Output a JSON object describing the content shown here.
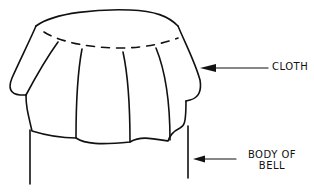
{
  "diagram": {
    "labels": {
      "cloth": "CLOTH",
      "body_line1": "BODY OF",
      "body_line2": "BELL"
    },
    "colors": {
      "line": "#111111",
      "background": "#ffffff"
    }
  }
}
